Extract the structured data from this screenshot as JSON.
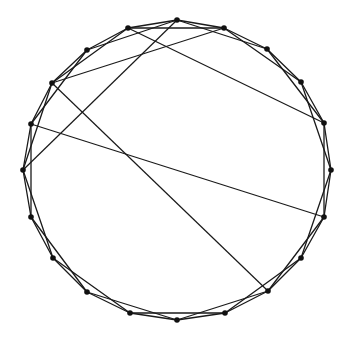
{
  "diagram": {
    "type": "graph",
    "layout": "circular",
    "node_count": 20,
    "ring_offsets": [
      1,
      2
    ],
    "colors": {
      "edge": "#1a1a1a",
      "node": "#111111",
      "background": "#ffffff"
    },
    "nodes": [
      {
        "id": 0,
        "x": 177,
        "y": 20
      },
      {
        "id": 1,
        "x": 224,
        "y": 28
      },
      {
        "id": 2,
        "x": 267,
        "y": 49
      },
      {
        "id": 3,
        "x": 301,
        "y": 82
      },
      {
        "id": 4,
        "x": 324,
        "y": 123
      },
      {
        "id": 5,
        "x": 331,
        "y": 170
      },
      {
        "id": 6,
        "x": 324,
        "y": 217
      },
      {
        "id": 7,
        "x": 301,
        "y": 258
      },
      {
        "id": 8,
        "x": 268,
        "y": 291
      },
      {
        "id": 9,
        "x": 225,
        "y": 313
      },
      {
        "id": 10,
        "x": 177,
        "y": 320
      },
      {
        "id": 11,
        "x": 130,
        "y": 313
      },
      {
        "id": 12,
        "x": 87,
        "y": 292
      },
      {
        "id": 13,
        "x": 53,
        "y": 258
      },
      {
        "id": 14,
        "x": 31,
        "y": 217
      },
      {
        "id": 15,
        "x": 23,
        "y": 170
      },
      {
        "id": 16,
        "x": 31,
        "y": 124
      },
      {
        "id": 17,
        "x": 52,
        "y": 83
      },
      {
        "id": 18,
        "x": 87,
        "y": 50
      },
      {
        "id": 19,
        "x": 128,
        "y": 28
      }
    ],
    "chords": [
      [
        0,
        15
      ],
      [
        1,
        17
      ],
      [
        19,
        4
      ],
      [
        17,
        8
      ],
      [
        16,
        6
      ]
    ]
  }
}
